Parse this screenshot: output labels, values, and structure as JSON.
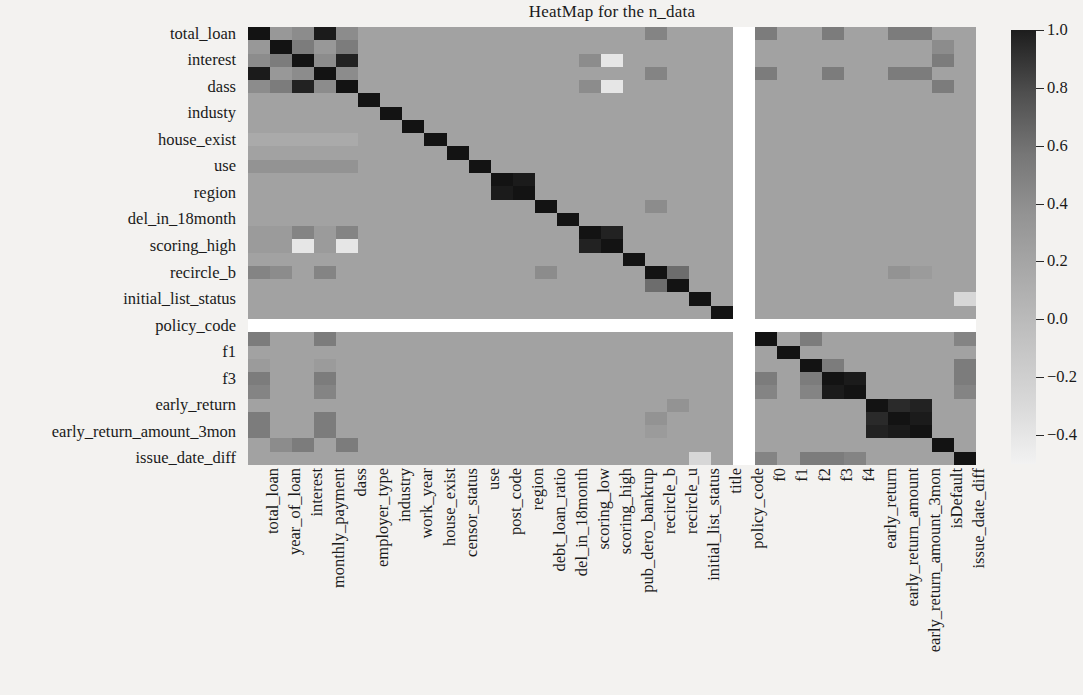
{
  "title": "HeatMap for the n_data",
  "chart_data": {
    "type": "heatmap",
    "title": "HeatMap for the n_data",
    "xlabel": "",
    "ylabel": "",
    "cmap": "grayscale-reversed",
    "grid": false,
    "legend_position": "right",
    "colorbar": {
      "vmin": -0.5,
      "vmax": 1.0,
      "ticks": [
        "1.0",
        "0.8",
        "0.6",
        "0.4",
        "0.2",
        "0.0",
        "−0.2",
        "−0.4"
      ],
      "tick_values": [
        1.0,
        0.8,
        0.6,
        0.4,
        0.2,
        0.0,
        -0.2,
        -0.4
      ],
      "low_color": "#f2f2f2",
      "high_color": "#1d1d1d"
    },
    "x_tick_labels": [
      "total_loan",
      "year_of_loan",
      "interest",
      "monthly_payment",
      "dass",
      "employer_type",
      "industry",
      "work_year",
      "house_exist",
      "censor_status",
      "use",
      "post_code",
      "region",
      "debt_loan_ratio",
      "del_in_18month",
      "scoring_low",
      "scoring_high",
      "pub_dero_bankrup",
      "recircle_b",
      "recircle_u",
      "initial_list_status",
      "title",
      "policy_code",
      "f0",
      "f1",
      "f2",
      "f3",
      "f4",
      "early_return",
      "early_return_amount",
      "early_return_amount_3mon",
      "isDefault",
      "issue_date_diff"
    ],
    "x_tick_shown": [
      "total_loan",
      "year_of_loan",
      "interest",
      "monthly_payment",
      "dass",
      "employer_type",
      "industry",
      "work_year",
      "house_exist",
      "censor_status",
      "use",
      "post_code",
      "region",
      "debt_loan_ratio",
      "del_in_18month",
      "scoring_low",
      "scoring_high",
      "pub_dero_bankrup",
      "recircle_b",
      "recircle_u",
      "initial_list_status",
      "title",
      "policy_code",
      "f0",
      "f1",
      "f2",
      "f3",
      "f4",
      "early_return",
      "early_return_amount",
      "early_return_amount_3mon",
      "isDefault",
      "issue_date_diff"
    ],
    "y_tick_labels": [
      "total_loan",
      "interest",
      "dass",
      "industy",
      "house_exist",
      "use",
      "region",
      "del_in_18month",
      "scoring_high",
      "recircle_b",
      "initial_list_status",
      "policy_code",
      "f1",
      "f3",
      "early_return",
      "early_return_amount_3mon",
      "issue_date_diff"
    ],
    "rows": 33,
    "cols": 33,
    "nan_row_index": 22,
    "nan_col_index": 22,
    "nan_label": "policy_code",
    "matrix": [
      [
        1.0,
        0.12,
        0.2,
        0.95,
        0.2,
        0.05,
        0.05,
        0.05,
        0.05,
        0.05,
        0.05,
        0.05,
        0.05,
        0.05,
        0.05,
        0.05,
        0.05,
        0.05,
        0.25,
        0.05,
        0.05,
        0.05,
        null,
        0.3,
        0.05,
        0.05,
        0.3,
        0.05,
        0.05,
        0.3,
        0.3,
        0.05,
        0.05
      ],
      [
        0.12,
        1.0,
        0.3,
        0.12,
        0.3,
        0.05,
        0.05,
        0.05,
        0.05,
        0.05,
        0.05,
        0.05,
        0.05,
        0.05,
        0.05,
        0.05,
        0.05,
        0.05,
        0.05,
        0.05,
        0.05,
        0.05,
        null,
        0.05,
        0.05,
        0.05,
        0.05,
        0.05,
        0.05,
        0.05,
        0.05,
        0.2,
        0.05
      ],
      [
        0.2,
        0.3,
        1.0,
        0.2,
        0.9,
        0.05,
        0.05,
        0.05,
        0.05,
        0.05,
        0.05,
        0.05,
        0.05,
        0.05,
        0.05,
        0.2,
        -0.4,
        0.05,
        0.05,
        0.05,
        0.05,
        0.05,
        null,
        0.05,
        0.05,
        0.05,
        0.05,
        0.05,
        0.05,
        0.05,
        0.05,
        0.3,
        0.05
      ],
      [
        0.95,
        0.12,
        0.2,
        1.0,
        0.2,
        0.05,
        0.05,
        0.05,
        0.05,
        0.05,
        0.05,
        0.05,
        0.05,
        0.05,
        0.05,
        0.05,
        0.05,
        0.05,
        0.25,
        0.05,
        0.05,
        0.05,
        null,
        0.3,
        0.05,
        0.05,
        0.3,
        0.05,
        0.05,
        0.3,
        0.3,
        0.05,
        0.05
      ],
      [
        0.2,
        0.3,
        0.9,
        0.2,
        1.0,
        0.05,
        0.05,
        0.05,
        0.05,
        0.05,
        0.05,
        0.05,
        0.05,
        0.05,
        0.05,
        0.2,
        -0.4,
        0.05,
        0.05,
        0.05,
        0.05,
        0.05,
        null,
        0.05,
        0.05,
        0.05,
        0.05,
        0.05,
        0.05,
        0.05,
        0.05,
        0.3,
        0.05
      ],
      [
        0.05,
        0.05,
        0.05,
        0.05,
        0.05,
        1.0,
        0.05,
        0.05,
        0.05,
        0.05,
        0.05,
        0.05,
        0.05,
        0.05,
        0.05,
        0.05,
        0.05,
        0.05,
        0.05,
        0.05,
        0.05,
        0.05,
        null,
        0.05,
        0.05,
        0.05,
        0.05,
        0.05,
        0.05,
        0.05,
        0.05,
        0.05,
        0.05
      ],
      [
        0.05,
        0.05,
        0.05,
        0.05,
        0.05,
        0.05,
        1.0,
        0.05,
        0.05,
        0.05,
        0.05,
        0.05,
        0.05,
        0.05,
        0.05,
        0.05,
        0.05,
        0.05,
        0.05,
        0.05,
        0.05,
        0.05,
        null,
        0.05,
        0.05,
        0.05,
        0.05,
        0.05,
        0.05,
        0.05,
        0.05,
        0.05,
        0.05
      ],
      [
        0.05,
        0.05,
        0.05,
        0.05,
        0.05,
        0.05,
        0.05,
        1.0,
        0.05,
        0.05,
        0.05,
        0.05,
        0.05,
        0.05,
        0.05,
        0.05,
        0.05,
        0.05,
        0.05,
        0.05,
        0.05,
        0.05,
        null,
        0.05,
        0.05,
        0.05,
        0.05,
        0.05,
        0.05,
        0.05,
        0.05,
        0.05,
        0.05
      ],
      [
        0.0,
        0.0,
        0.0,
        0.0,
        0.0,
        0.05,
        0.05,
        0.05,
        1.0,
        0.05,
        0.05,
        0.05,
        0.05,
        0.05,
        0.05,
        0.05,
        0.05,
        0.05,
        0.05,
        0.05,
        0.05,
        0.05,
        null,
        0.05,
        0.05,
        0.05,
        0.05,
        0.05,
        0.05,
        0.05,
        0.05,
        0.05,
        0.05
      ],
      [
        0.05,
        0.05,
        0.05,
        0.05,
        0.05,
        0.05,
        0.05,
        0.05,
        0.05,
        1.0,
        0.05,
        0.05,
        0.05,
        0.05,
        0.05,
        0.05,
        0.05,
        0.05,
        0.05,
        0.05,
        0.05,
        0.05,
        null,
        0.05,
        0.05,
        0.05,
        0.05,
        0.05,
        0.05,
        0.05,
        0.05,
        0.05,
        0.05
      ],
      [
        0.15,
        0.15,
        0.15,
        0.15,
        0.15,
        0.05,
        0.05,
        0.05,
        0.05,
        0.05,
        1.0,
        0.05,
        0.05,
        0.05,
        0.05,
        0.05,
        0.05,
        0.05,
        0.05,
        0.05,
        0.05,
        0.05,
        null,
        0.05,
        0.05,
        0.05,
        0.05,
        0.05,
        0.05,
        0.05,
        0.05,
        0.05,
        0.05
      ],
      [
        0.05,
        0.05,
        0.05,
        0.05,
        0.05,
        0.05,
        0.05,
        0.05,
        0.05,
        0.05,
        0.05,
        1.0,
        0.95,
        0.05,
        0.05,
        0.05,
        0.05,
        0.05,
        0.05,
        0.05,
        0.05,
        0.05,
        null,
        0.05,
        0.05,
        0.05,
        0.05,
        0.05,
        0.05,
        0.05,
        0.05,
        0.05,
        0.05
      ],
      [
        0.05,
        0.05,
        0.05,
        0.05,
        0.05,
        0.05,
        0.05,
        0.05,
        0.05,
        0.05,
        0.05,
        0.95,
        1.0,
        0.05,
        0.05,
        0.05,
        0.05,
        0.05,
        0.05,
        0.05,
        0.05,
        0.05,
        null,
        0.05,
        0.05,
        0.05,
        0.05,
        0.05,
        0.05,
        0.05,
        0.05,
        0.05,
        0.05
      ],
      [
        0.05,
        0.05,
        0.05,
        0.05,
        0.05,
        0.05,
        0.05,
        0.05,
        0.05,
        0.05,
        0.05,
        0.05,
        0.05,
        1.0,
        0.05,
        0.05,
        0.05,
        0.05,
        0.2,
        0.05,
        0.05,
        0.05,
        null,
        0.05,
        0.05,
        0.05,
        0.05,
        0.05,
        0.05,
        0.05,
        0.05,
        0.05,
        0.05
      ],
      [
        0.05,
        0.05,
        0.05,
        0.05,
        0.05,
        0.05,
        0.05,
        0.05,
        0.05,
        0.05,
        0.05,
        0.05,
        0.05,
        0.05,
        1.0,
        0.05,
        0.05,
        0.05,
        0.05,
        0.05,
        0.05,
        0.05,
        null,
        0.05,
        0.05,
        0.05,
        0.05,
        0.05,
        0.05,
        0.05,
        0.05,
        0.05,
        0.05
      ],
      [
        0.1,
        0.1,
        0.25,
        0.1,
        0.25,
        0.05,
        0.05,
        0.05,
        0.05,
        0.05,
        0.05,
        0.05,
        0.05,
        0.05,
        0.05,
        1.0,
        0.9,
        0.05,
        0.05,
        0.05,
        0.05,
        0.05,
        null,
        0.05,
        0.05,
        0.05,
        0.05,
        0.05,
        0.05,
        0.05,
        0.05,
        0.05,
        0.05
      ],
      [
        0.1,
        0.1,
        -0.4,
        0.1,
        -0.4,
        0.05,
        0.05,
        0.05,
        0.05,
        0.05,
        0.05,
        0.05,
        0.05,
        0.05,
        0.05,
        0.9,
        1.0,
        0.05,
        0.05,
        0.05,
        0.05,
        0.05,
        null,
        0.05,
        0.05,
        0.05,
        0.05,
        0.05,
        0.05,
        0.05,
        0.05,
        0.05,
        0.05
      ],
      [
        0.05,
        0.05,
        0.05,
        0.05,
        0.05,
        0.05,
        0.05,
        0.05,
        0.05,
        0.05,
        0.05,
        0.05,
        0.05,
        0.05,
        0.05,
        0.05,
        0.05,
        1.0,
        0.05,
        0.05,
        0.05,
        0.05,
        null,
        0.05,
        0.05,
        0.05,
        0.05,
        0.05,
        0.05,
        0.05,
        0.05,
        0.05,
        0.05
      ],
      [
        0.25,
        0.2,
        0.05,
        0.25,
        0.05,
        0.05,
        0.05,
        0.05,
        0.05,
        0.05,
        0.05,
        0.05,
        0.05,
        0.2,
        0.05,
        0.05,
        0.05,
        0.05,
        1.0,
        0.4,
        0.05,
        0.05,
        null,
        0.05,
        0.05,
        0.05,
        0.05,
        0.05,
        0.05,
        0.15,
        0.1,
        0.05,
        0.05
      ],
      [
        0.05,
        0.05,
        0.05,
        0.05,
        0.05,
        0.05,
        0.05,
        0.05,
        0.05,
        0.05,
        0.05,
        0.05,
        0.05,
        0.05,
        0.05,
        0.05,
        0.05,
        0.05,
        0.4,
        1.0,
        0.05,
        0.05,
        null,
        0.05,
        0.05,
        0.05,
        0.05,
        0.05,
        0.05,
        0.05,
        0.05,
        0.05,
        0.05
      ],
      [
        0.05,
        0.05,
        0.05,
        0.05,
        0.05,
        0.05,
        0.05,
        0.05,
        0.05,
        0.05,
        0.05,
        0.05,
        0.05,
        0.05,
        0.05,
        0.05,
        0.05,
        0.05,
        0.05,
        0.05,
        1.0,
        0.05,
        null,
        0.05,
        0.05,
        0.05,
        0.05,
        0.05,
        0.05,
        0.05,
        0.05,
        0.05,
        -0.3
      ],
      [
        0.05,
        0.05,
        0.05,
        0.05,
        0.05,
        0.05,
        0.05,
        0.05,
        0.05,
        0.05,
        0.05,
        0.05,
        0.05,
        0.05,
        0.05,
        0.05,
        0.05,
        0.05,
        0.05,
        0.05,
        0.05,
        1.0,
        null,
        0.05,
        0.05,
        0.05,
        0.05,
        0.05,
        0.05,
        0.05,
        0.05,
        0.05,
        0.05
      ],
      [
        null,
        null,
        null,
        null,
        null,
        null,
        null,
        null,
        null,
        null,
        null,
        null,
        null,
        null,
        null,
        null,
        null,
        null,
        null,
        null,
        null,
        null,
        null,
        null,
        null,
        null,
        null,
        null,
        null,
        null,
        null,
        null,
        null
      ],
      [
        0.3,
        0.05,
        0.05,
        0.3,
        0.05,
        0.05,
        0.05,
        0.05,
        0.05,
        0.05,
        0.05,
        0.05,
        0.05,
        0.05,
        0.05,
        0.05,
        0.05,
        0.05,
        0.05,
        0.05,
        0.05,
        0.05,
        null,
        1.0,
        0.05,
        0.3,
        0.05,
        0.05,
        0.05,
        0.05,
        0.05,
        0.05,
        0.25
      ],
      [
        0.05,
        0.05,
        0.05,
        0.05,
        0.05,
        0.05,
        0.05,
        0.05,
        0.05,
        0.05,
        0.05,
        0.05,
        0.05,
        0.05,
        0.05,
        0.05,
        0.05,
        0.05,
        0.05,
        0.05,
        0.05,
        0.05,
        null,
        0.05,
        1.0,
        0.05,
        0.05,
        0.05,
        0.05,
        0.05,
        0.05,
        0.05,
        0.05
      ],
      [
        0.1,
        0.05,
        0.05,
        0.1,
        0.05,
        0.05,
        0.05,
        0.05,
        0.05,
        0.05,
        0.05,
        0.05,
        0.05,
        0.05,
        0.05,
        0.05,
        0.05,
        0.05,
        0.05,
        0.05,
        0.05,
        0.05,
        null,
        0.05,
        0.05,
        1.0,
        0.3,
        0.05,
        0.05,
        0.05,
        0.05,
        0.05,
        0.3
      ],
      [
        0.3,
        0.05,
        0.05,
        0.3,
        0.05,
        0.05,
        0.05,
        0.05,
        0.05,
        0.05,
        0.05,
        0.05,
        0.05,
        0.05,
        0.05,
        0.05,
        0.05,
        0.05,
        0.05,
        0.05,
        0.05,
        0.05,
        null,
        0.3,
        0.05,
        0.3,
        1.0,
        0.95,
        0.05,
        0.05,
        0.05,
        0.05,
        0.3
      ],
      [
        0.25,
        0.05,
        0.05,
        0.25,
        0.05,
        0.05,
        0.05,
        0.05,
        0.05,
        0.05,
        0.05,
        0.05,
        0.05,
        0.05,
        0.05,
        0.05,
        0.05,
        0.05,
        0.05,
        0.05,
        0.05,
        0.05,
        null,
        0.25,
        0.05,
        0.25,
        0.95,
        1.0,
        0.05,
        0.05,
        0.05,
        0.05,
        0.25
      ],
      [
        0.05,
        0.05,
        0.05,
        0.05,
        0.05,
        0.05,
        0.05,
        0.05,
        0.05,
        0.05,
        0.05,
        0.05,
        0.05,
        0.05,
        0.05,
        0.05,
        0.05,
        0.05,
        0.05,
        0.15,
        0.05,
        0.05,
        null,
        0.05,
        0.05,
        0.05,
        0.05,
        0.05,
        1.0,
        0.85,
        0.9,
        0.05,
        0.05
      ],
      [
        0.3,
        0.05,
        0.05,
        0.3,
        0.05,
        0.05,
        0.05,
        0.05,
        0.05,
        0.05,
        0.05,
        0.05,
        0.05,
        0.05,
        0.05,
        0.05,
        0.05,
        0.05,
        0.15,
        0.05,
        0.05,
        0.05,
        null,
        0.05,
        0.05,
        0.05,
        0.05,
        0.05,
        0.85,
        1.0,
        0.95,
        0.05,
        0.05
      ],
      [
        0.3,
        0.05,
        0.05,
        0.3,
        0.05,
        0.05,
        0.05,
        0.05,
        0.05,
        0.05,
        0.05,
        0.05,
        0.05,
        0.05,
        0.05,
        0.05,
        0.05,
        0.05,
        0.1,
        0.05,
        0.05,
        0.05,
        null,
        0.05,
        0.05,
        0.05,
        0.05,
        0.05,
        0.9,
        0.95,
        1.0,
        0.05,
        0.05
      ],
      [
        0.05,
        0.2,
        0.3,
        0.05,
        0.3,
        0.05,
        0.05,
        0.05,
        0.05,
        0.05,
        0.05,
        0.05,
        0.05,
        0.05,
        0.05,
        0.05,
        0.05,
        0.05,
        0.05,
        0.05,
        0.05,
        0.05,
        null,
        0.05,
        0.05,
        0.05,
        0.05,
        0.05,
        0.05,
        0.05,
        0.05,
        1.0,
        0.05
      ],
      [
        0.05,
        0.05,
        0.05,
        0.05,
        0.05,
        0.05,
        0.05,
        0.05,
        0.05,
        0.05,
        0.05,
        0.05,
        0.05,
        0.05,
        0.05,
        0.05,
        0.05,
        0.05,
        0.05,
        0.05,
        -0.3,
        0.05,
        null,
        0.25,
        0.05,
        0.3,
        0.3,
        0.25,
        0.05,
        0.05,
        0.05,
        0.05,
        1.0
      ]
    ]
  }
}
